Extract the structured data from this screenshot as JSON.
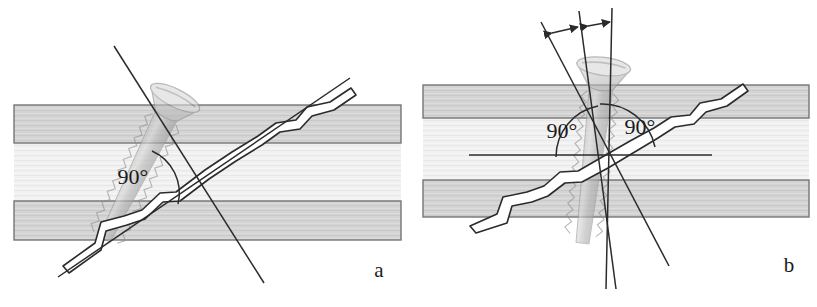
{
  "figure": {
    "type": "anatomical-diagram",
    "background_color": "#ffffff",
    "panels": [
      {
        "id": "a",
        "letter_label": "a",
        "letter_position": {
          "x": 379,
          "y": 277
        },
        "angle_labels": [
          {
            "text": "90°",
            "x": 133,
            "y": 184
          }
        ],
        "cortex_color": "#d2d2d2",
        "medulla_color": "#efefef",
        "outline_color": "#6b6b6b",
        "bone": {
          "left": 14,
          "right": 401,
          "top_cortex": {
            "y": 105,
            "height": 38
          },
          "medulla": {
            "y": 143,
            "height": 58
          },
          "bottom_cortex": {
            "y": 201,
            "height": 39
          }
        },
        "screw": {
          "orientation": "perpendicular-to-fracture",
          "head_center": {
            "x": 164,
            "y": 104
          },
          "tip": {
            "x": 237,
            "y": 250
          },
          "axis_angle_deg": 64,
          "shank_color": "#b9b9b9",
          "thread_color": "#a8a8a8"
        },
        "guide_lines": [
          {
            "name": "screw-axis-line",
            "x1": 114,
            "y1": 46,
            "x2": 264,
            "y2": 283
          },
          {
            "name": "fracture-axis-line",
            "x1": 58,
            "y1": 276,
            "x2": 349,
            "y2": 79
          }
        ],
        "fracture": {
          "name": "oblique-fracture-line",
          "gap_fill": "#ffffff",
          "stroke": "#2b2b2b"
        }
      },
      {
        "id": "b",
        "letter_label": "b",
        "letter_position": {
          "x": 789,
          "y": 272
        },
        "angle_labels": [
          {
            "text": "90°",
            "x": 562,
            "y": 138
          },
          {
            "text": "90°",
            "x": 628,
            "y": 134
          }
        ],
        "cortex_color": "#d2d2d2",
        "medulla_color": "#efefef",
        "outline_color": "#6b6b6b",
        "bone": {
          "left": 423,
          "right": 809,
          "top_cortex": {
            "y": 85,
            "height": 33
          },
          "medulla": {
            "y": 118,
            "height": 62
          },
          "bottom_cortex": {
            "y": 180,
            "height": 37
          }
        },
        "screw": {
          "orientation": "bisecting-angle",
          "head_center": {
            "x": 587,
            "y": 74
          },
          "tip": {
            "x": 632,
            "y": 242
          },
          "axis_angle_deg": 75,
          "shank_color": "#b9b9b9",
          "thread_color": "#a8a8a8"
        },
        "guide_lines": [
          {
            "name": "perpendicular-to-shaft-line",
            "x1": 541,
            "y1": 22,
            "x2": 669,
            "y2": 266
          },
          {
            "name": "bisector-line",
            "x1": 579,
            "y1": 11,
            "x2": 615,
            "y2": 289
          },
          {
            "name": "perpendicular-to-fracture-line",
            "x1": 612,
            "y1": 8,
            "x2": 612,
            "y2": 289
          }
        ],
        "arrows": [
          {
            "name": "angle-arrow-left",
            "x1": 550,
            "y1": 33,
            "x2": 580,
            "y2": 27
          },
          {
            "name": "angle-arrow-right",
            "x1": 587,
            "y1": 25,
            "x2": 612,
            "y2": 22
          }
        ],
        "axis_marker": {
          "name": "horizontal-shaft-axis",
          "x1": 469,
          "y1": 155,
          "x2": 712,
          "y2": 155
        },
        "fracture": {
          "name": "oblique-fracture-line",
          "gap_fill": "#ffffff",
          "stroke": "#2b2b2b"
        }
      }
    ]
  }
}
